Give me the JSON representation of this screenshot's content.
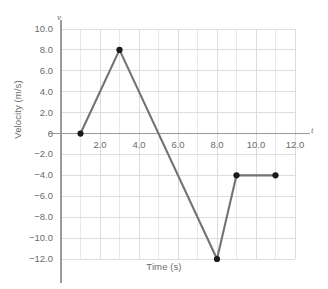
{
  "chart_data": {
    "type": "line",
    "title": "",
    "xlabel": "Time (s)",
    "ylabel": "Velocity (m/s)",
    "x_axis_symbol": "t",
    "y_axis_symbol": "v",
    "xlim": [
      0,
      12
    ],
    "ylim": [
      -12,
      10
    ],
    "xticks": [
      2,
      4,
      6,
      8,
      10,
      12
    ],
    "xtick_labels": [
      "2.0",
      "4.0",
      "6.0",
      "8.0",
      "10.0",
      "12.0"
    ],
    "yticks": [
      10,
      8,
      6,
      4,
      2,
      0,
      -2,
      -4,
      -6,
      -8,
      -10,
      -12
    ],
    "ytick_labels": [
      "10.0",
      "8.0",
      "6.0",
      "4.0",
      "2.0",
      "0",
      "−2.0",
      "−4.0",
      "−6.0",
      "−8.0",
      "−10.0",
      "−12.0"
    ],
    "grid": true,
    "grid_minor_step_x": 1,
    "grid_minor_step_y": 2,
    "legend": null,
    "series": [
      {
        "name": "velocity",
        "x": [
          1,
          3,
          8,
          9,
          11
        ],
        "values": [
          0,
          8,
          -12,
          -4,
          -4
        ],
        "line_color": "#737373",
        "marker_color": "#1a1a1a",
        "marker": "circle"
      }
    ],
    "zero_crossing_x": 5
  },
  "colors": {
    "line": "#737373",
    "marker": "#1a1a1a",
    "grid": "#d9d9de",
    "axis": "#9a9a9a",
    "text": "#6b6b6b",
    "background": "#ffffff"
  }
}
